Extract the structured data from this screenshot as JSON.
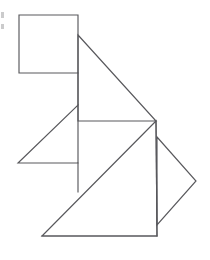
{
  "image": {
    "title": "Tangram Silhouette Figure",
    "description": "Black-and-white line drawing of a tangram-style figure composed of one square and several triangles forming a seated animal shape",
    "width": 210,
    "height": 260,
    "background_color": "#ffffff",
    "stroke_color": "#58585c",
    "stroke_width": 1.15
  },
  "figure": {
    "type": "tangram",
    "piece_count": 7,
    "shapes": [
      {
        "name": "head-square",
        "kind": "square",
        "points": "19,15 78,15 78,73 19,73"
      },
      {
        "name": "neck-vertical-segment",
        "kind": "line",
        "points": "78,73 78,105"
      },
      {
        "name": "large-upper-triangle",
        "kind": "triangle",
        "points": "78,35 156,121 78,121"
      },
      {
        "name": "left-arm-triangle",
        "kind": "triangle",
        "points": "78,105 78,163 18,163"
      },
      {
        "name": "body-vertical-segment",
        "kind": "line",
        "points": "78,163 78,192"
      },
      {
        "name": "large-lower-triangle",
        "kind": "triangle",
        "points": "156,121 157,236 42,236"
      },
      {
        "name": "right-tail-triangle",
        "kind": "triangle",
        "points": "157,137 196,181 157,225"
      },
      {
        "name": "right-vertical-edge",
        "kind": "line",
        "points": "156,121 157,236"
      },
      {
        "name": "bottom-base-edge",
        "kind": "line",
        "points": "42,236 157,236"
      }
    ],
    "artifacts": [
      {
        "name": "scan-artifact-upper",
        "x": 1,
        "y": 12,
        "width": 3,
        "height": 6,
        "color": "#b9b9bb"
      },
      {
        "name": "scan-artifact-lower",
        "x": 1,
        "y": 24,
        "width": 3,
        "height": 5,
        "color": "#b9b9bb"
      }
    ]
  }
}
